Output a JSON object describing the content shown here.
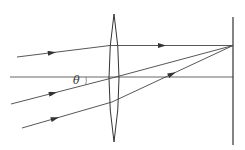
{
  "diagram": {
    "type": "optics-ray-diagram",
    "angle_label": "θ",
    "colors": {
      "line": "#444444",
      "background": "#ffffff"
    },
    "elements": {
      "lens": {
        "kind": "convex-lens",
        "center_x": 114,
        "top_y": 14,
        "bottom_y": 142,
        "half_width": 5
      },
      "screen": {
        "kind": "focal-plane-screen",
        "x": 233,
        "top_y": 17,
        "bottom_y": 145
      },
      "optical_axis": {
        "y": 77,
        "x_start": 10,
        "x_end": 233
      },
      "focal_point": {
        "x": 233,
        "y": 46
      },
      "rays": [
        {
          "name": "ray-top",
          "incident": [
            [
              17,
              57
            ],
            [
              109,
              46
            ]
          ],
          "refracted": [
            [
              109,
              46
            ],
            [
              233,
              46
            ]
          ]
        },
        {
          "name": "ray-middle",
          "incident": [
            [
              11,
              104
            ],
            [
              112,
              78
            ]
          ],
          "refracted": [
            [
              112,
              78
            ],
            [
              233,
              46
            ]
          ]
        },
        {
          "name": "ray-bottom",
          "incident": [
            [
              22,
              128
            ],
            [
              112,
              102
            ]
          ],
          "refracted": [
            [
              112,
              102
            ],
            [
              233,
              46
            ]
          ]
        }
      ]
    }
  }
}
